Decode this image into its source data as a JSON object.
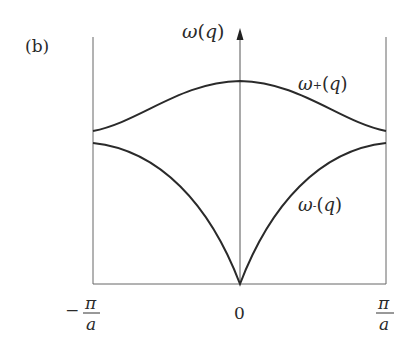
{
  "panel_label": "(b)",
  "y_axis_label": "ω(q)",
  "curves": [
    {
      "name": "ω+(q)",
      "label_main": "ω",
      "label_sub": "+",
      "label_arg": "(q)",
      "description": "optical branch: maximum at q=0, decreasing toward zone edges"
    },
    {
      "name": "ω-(q)",
      "label_main": "ω",
      "label_sub": "-",
      "label_arg": "(q)",
      "description": "acoustic branch: zero at q=0, increasing toward zone edges"
    }
  ],
  "x_ticks": {
    "left_sign": "−",
    "left_num": "π",
    "left_den": "a",
    "center": "0",
    "right_num": "π",
    "right_den": "a"
  },
  "colors": {
    "curve": "#2a2a2a",
    "axis": "#555555",
    "text": "#2a2a2a"
  }
}
